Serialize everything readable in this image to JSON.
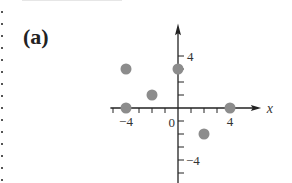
{
  "figure": {
    "label": "(a)"
  },
  "chart_data": {
    "type": "scatter",
    "title": "",
    "xlabel": "x",
    "ylabel": "",
    "xlim": [
      -5,
      5.5
    ],
    "ylim": [
      -5.5,
      5.5
    ],
    "grid": false,
    "x_tick_labels": [
      {
        "value": -4,
        "text": "−4"
      },
      {
        "value": 4,
        "text": "4"
      }
    ],
    "y_tick_labels": [
      {
        "value": 4,
        "text": "4"
      },
      {
        "value": -4,
        "text": "−4"
      }
    ],
    "origin_label": "0",
    "points": [
      {
        "x": -4,
        "y": 3
      },
      {
        "x": 0,
        "y": 3
      },
      {
        "x": -2,
        "y": 1
      },
      {
        "x": -4,
        "y": 0
      },
      {
        "x": 4,
        "y": 0
      },
      {
        "x": 2,
        "y": -2
      }
    ],
    "point_color": "#8c8c8c",
    "axis_color": "#222222"
  }
}
